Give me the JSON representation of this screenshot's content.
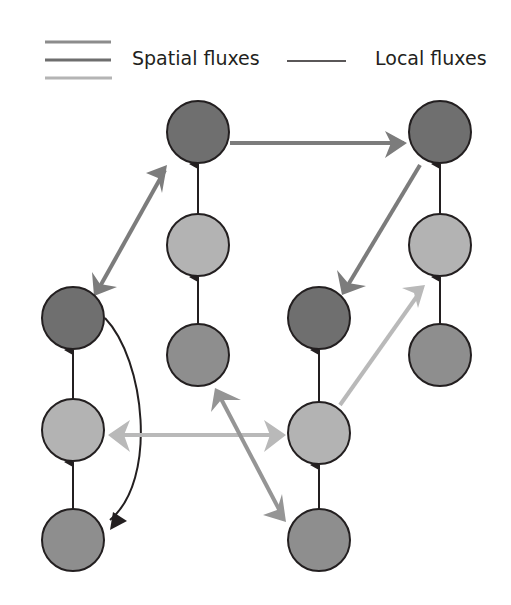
{
  "legend": {
    "spatial_label": "Spatial fluxes",
    "local_label": "Local fluxes",
    "spatial_colors": [
      "#8c8c8c",
      "#6e6e6e",
      "#b4b4b4"
    ],
    "local_color": "#231f20"
  },
  "colors": {
    "node_dark": "#6f6f6f",
    "node_light": "#b3b3b3",
    "node_mid": "#8e8e8e",
    "node_stroke": "#231f20",
    "flux_dark": "#7c7c7c",
    "flux_mid": "#959595",
    "flux_light": "#b9b9b9"
  },
  "nodes": [
    {
      "id": "A1",
      "column": "A",
      "level": "top",
      "shade": "dark"
    },
    {
      "id": "A2",
      "column": "A",
      "level": "middle",
      "shade": "light"
    },
    {
      "id": "A3",
      "column": "A",
      "level": "bottom",
      "shade": "mid"
    },
    {
      "id": "B1",
      "column": "B",
      "level": "top",
      "shade": "dark"
    },
    {
      "id": "B2",
      "column": "B",
      "level": "middle",
      "shade": "light"
    },
    {
      "id": "B3",
      "column": "B",
      "level": "bottom",
      "shade": "mid"
    },
    {
      "id": "C1",
      "column": "C",
      "level": "top",
      "shade": "dark"
    },
    {
      "id": "C2",
      "column": "C",
      "level": "middle",
      "shade": "light"
    },
    {
      "id": "C3",
      "column": "C",
      "level": "bottom",
      "shade": "mid"
    },
    {
      "id": "D1",
      "column": "D",
      "level": "top",
      "shade": "dark"
    },
    {
      "id": "D2",
      "column": "D",
      "level": "middle",
      "shade": "light"
    },
    {
      "id": "D3",
      "column": "D",
      "level": "bottom",
      "shade": "mid"
    }
  ],
  "edges": [
    {
      "from": "A3",
      "to": "A2",
      "type": "local"
    },
    {
      "from": "A2",
      "to": "A1",
      "type": "local"
    },
    {
      "from": "A1",
      "to": "A3",
      "type": "local",
      "curved": true
    },
    {
      "from": "B3",
      "to": "B2",
      "type": "local"
    },
    {
      "from": "B2",
      "to": "B1",
      "type": "local"
    },
    {
      "from": "C3",
      "to": "C2",
      "type": "local"
    },
    {
      "from": "C2",
      "to": "C1",
      "type": "local"
    },
    {
      "from": "D3",
      "to": "D2",
      "type": "local"
    },
    {
      "from": "D2",
      "to": "D1",
      "type": "local"
    },
    {
      "from": "B1",
      "to": "D1",
      "type": "spatial",
      "shade": "dark"
    },
    {
      "from": "D1",
      "to": "C1",
      "type": "spatial",
      "shade": "dark"
    },
    {
      "from": "A1",
      "to": "B1",
      "type": "spatial",
      "shade": "dark",
      "bidirectional": true
    },
    {
      "from": "A2",
      "to": "C2",
      "type": "spatial",
      "shade": "light",
      "bidirectional": true
    },
    {
      "from": "C2",
      "to": "D2",
      "type": "spatial",
      "shade": "light"
    },
    {
      "from": "B3",
      "to": "C3",
      "type": "spatial",
      "shade": "mid",
      "bidirectional": true
    }
  ]
}
